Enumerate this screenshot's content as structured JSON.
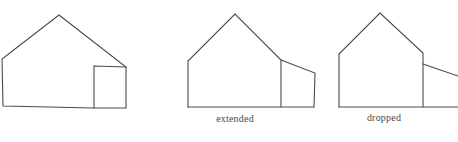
{
  "figures": [
    {
      "id": "original",
      "label": "",
      "house": [
        [
          3,
          106
        ],
        [
          2,
          59
        ],
        [
          59,
          15
        ],
        [
          126,
          67
        ],
        [
          126,
          108
        ],
        [
          94,
          108
        ]
      ],
      "annex": [
        [
          94,
          108
        ],
        [
          94,
          66
        ],
        [
          126,
          67
        ],
        [
          126,
          108
        ]
      ],
      "base": [
        [
          3,
          106
        ],
        [
          94,
          108
        ]
      ]
    },
    {
      "id": "extended",
      "label": "extended",
      "label_pos": [
        235,
        114
      ],
      "house": [
        [
          188,
          107
        ],
        [
          188,
          61
        ],
        [
          235,
          14
        ],
        [
          281,
          60
        ],
        [
          281,
          107
        ]
      ],
      "annex": [
        [
          281,
          60
        ],
        [
          315,
          73
        ],
        [
          314,
          107
        ],
        [
          281,
          107
        ]
      ],
      "base": [
        [
          188,
          107
        ],
        [
          314,
          107
        ]
      ]
    },
    {
      "id": "dropped",
      "label": "dropped",
      "label_pos": [
        384,
        113
      ],
      "house": [
        [
          339,
          107
        ],
        [
          339,
          54
        ],
        [
          380,
          13
        ],
        [
          423,
          53
        ],
        [
          423,
          107
        ]
      ],
      "annex": [
        [
          423,
          64
        ],
        [
          458,
          76
        ]
      ],
      "base": [
        [
          339,
          107
        ],
        [
          458,
          107
        ]
      ]
    }
  ],
  "colors": {
    "stroke": "#4a4a4a",
    "background": "#ffffff"
  }
}
